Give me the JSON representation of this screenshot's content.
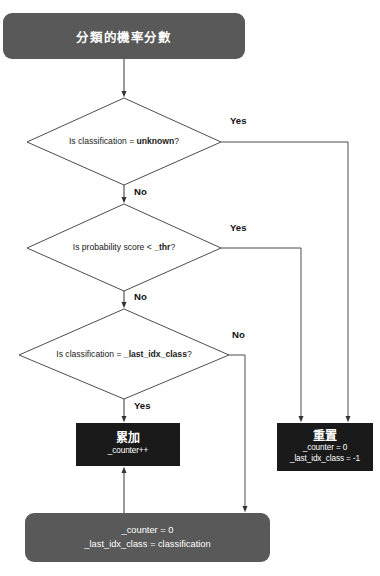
{
  "diagram": {
    "type": "flowchart",
    "title_node": {
      "text": "分類的機率分數",
      "shape": "rounded-rectangle",
      "fill": "#595959",
      "text_color": "#ffffff"
    },
    "decisions": [
      {
        "id": "d1",
        "prefix": "Is classification = ",
        "emphasis": "unknown",
        "suffix": "?",
        "yes_label": "Yes",
        "no_label": "No"
      },
      {
        "id": "d2",
        "prefix": "Is probability score < ",
        "emphasis": "_thr",
        "suffix": "?",
        "yes_label": "Yes",
        "no_label": "No"
      },
      {
        "id": "d3",
        "prefix": "Is classification = ",
        "emphasis": "_last_idx_class",
        "suffix": "?",
        "yes_label": "Yes",
        "no_label": "No"
      }
    ],
    "process_nodes": [
      {
        "id": "accumulate",
        "title": "累加",
        "lines": [
          "_counter++"
        ],
        "fill": "#1a1a1a",
        "text_color": "#ffffff"
      },
      {
        "id": "reset",
        "title": "重置",
        "lines": [
          "_counter = 0",
          "_last_idx_class = -1"
        ],
        "fill": "#1a1a1a",
        "text_color": "#ffffff"
      }
    ],
    "footer_node": {
      "id": "assign",
      "lines": [
        "_counter = 0",
        "_last_idx_class = classification"
      ],
      "shape": "rounded-rectangle",
      "fill": "#595959",
      "text_color": "#ffffff"
    },
    "colors": {
      "gray_fill": "#595959",
      "black_fill": "#1a1a1a",
      "line": "#4d4d4d",
      "background": "#ffffff",
      "label_text": "#111111"
    }
  }
}
